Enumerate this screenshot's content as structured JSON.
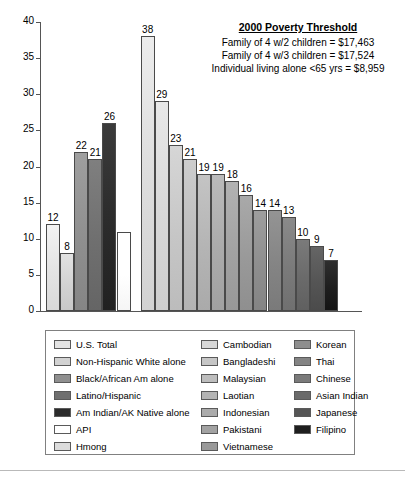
{
  "chart_data": {
    "type": "bar",
    "title": "",
    "xlabel": "",
    "ylabel": "",
    "ylim": [
      0,
      40
    ],
    "ytick_step": 5,
    "yticks": [
      0,
      5,
      10,
      15,
      20,
      25,
      30,
      35,
      40
    ],
    "grid": false,
    "legend_position": "below-plot",
    "group_gap_after_index": 5,
    "categories": [
      "U.S. Total",
      "Non-Hispanic White alone",
      "Black/African Am alone",
      "Latino/Hispanic",
      "Am Indian/AK Native alone",
      "API",
      "Hmong",
      "Cambodian",
      "Bangladeshi",
      "Malaysian",
      "Laotian",
      "Indonesian",
      "Pakistani",
      "Vietnamese",
      "Korean",
      "Thai",
      "Chinese",
      "Asian Indian",
      "Japanese",
      "Filipino"
    ],
    "values": [
      12,
      8,
      22,
      21,
      26,
      11,
      38,
      29,
      23,
      21,
      19,
      19,
      18,
      16,
      14,
      14,
      13,
      10,
      9,
      7
    ],
    "value_labels": [
      "12",
      "8",
      "22",
      "21",
      "26",
      "",
      "38",
      "29",
      "23",
      "21",
      "19",
      "19",
      "18",
      "16",
      "14",
      "14",
      "13",
      "10",
      "9",
      "7"
    ],
    "colors": [
      "#e3e3e3",
      "#d2d2d2",
      "#8f8f8f",
      "#6f6f6f",
      "#2b2b2b",
      "#ffffff",
      "#dcdcdc",
      "#d8d8d8",
      "#c6c6c6",
      "#bdbdbd",
      "#b4b4b4",
      "#ababab",
      "#a2a2a2",
      "#999999",
      "#8e8e8e",
      "#848484",
      "#7a7a7a",
      "#6a6a6a",
      "#555555",
      "#1e1e1e"
    ]
  },
  "annotation": {
    "title": "2000 Poverty Threshold",
    "lines": [
      "Family of 4 w/2 children = $17,463",
      "Family of 4 w/3 children = $17,524",
      "Individual living alone <65 yrs = $8,959"
    ]
  },
  "legend": {
    "columns": [
      {
        "items": [
          {
            "label": "U.S. Total",
            "color": "#e3e3e3"
          },
          {
            "label": "Non-Hispanic White alone",
            "color": "#d2d2d2"
          },
          {
            "label": "Black/African Am alone",
            "color": "#8f8f8f"
          },
          {
            "label": "Latino/Hispanic",
            "color": "#6f6f6f"
          },
          {
            "label": "Am Indian/AK Native alone",
            "color": "#2b2b2b"
          },
          {
            "label": "API",
            "color": "#ffffff"
          },
          {
            "label": "Hmong",
            "color": "#dcdcdc"
          }
        ]
      },
      {
        "items": [
          {
            "label": "Cambodian",
            "color": "#d8d8d8"
          },
          {
            "label": "Bangladeshi",
            "color": "#c6c6c6"
          },
          {
            "label": "Malaysian",
            "color": "#bdbdbd"
          },
          {
            "label": "Laotian",
            "color": "#b4b4b4"
          },
          {
            "label": "Indonesian",
            "color": "#ababab"
          },
          {
            "label": "Pakistani",
            "color": "#a2a2a2"
          },
          {
            "label": "Vietnamese",
            "color": "#999999"
          }
        ]
      },
      {
        "items": [
          {
            "label": "Korean",
            "color": "#8e8e8e"
          },
          {
            "label": "Thai",
            "color": "#848484"
          },
          {
            "label": "Chinese",
            "color": "#7a7a7a"
          },
          {
            "label": "Asian Indian",
            "color": "#6a6a6a"
          },
          {
            "label": "Japanese",
            "color": "#555555"
          },
          {
            "label": "Filipino",
            "color": "#1e1e1e"
          }
        ]
      }
    ]
  }
}
